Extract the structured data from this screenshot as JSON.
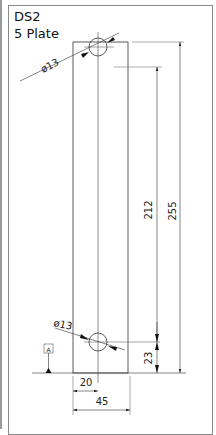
{
  "title": {
    "line1": "DS2",
    "line2": "5 Plate"
  },
  "drawing": {
    "part": "Plate",
    "stroke_color": "#333333",
    "frame_color": "#8a8a8a",
    "datum_label": "A",
    "dimensions": {
      "hole_top_diameter": "ø13",
      "hole_bottom_diameter": "ø13",
      "hole_spacing": "212",
      "overall_length": "255",
      "bottom_hole_offset": "23",
      "hole_x_offset": "20",
      "width": "45"
    }
  }
}
